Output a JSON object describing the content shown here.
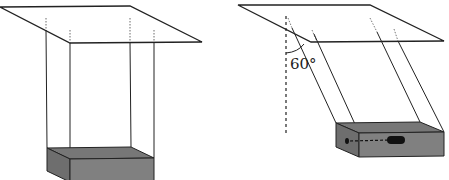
{
  "figure": {
    "left_panel": {
      "strings": 4,
      "orientation": "vertical"
    },
    "right_panel": {
      "strings": 4,
      "angle_label": "60°",
      "has_reference_vertical": true,
      "box_detail": "dot and dashed line leading to a dark slot on the side face"
    },
    "colors": {
      "line": "#222222",
      "box_top": "#777777",
      "box_front": "#808080",
      "box_side": "#6e6e6e",
      "slot": "#111111"
    }
  }
}
